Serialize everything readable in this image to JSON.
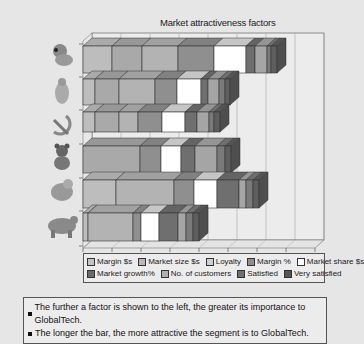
{
  "chart_data": {
    "type": "bar",
    "orientation": "horizontal",
    "stacked": true,
    "style": "3d",
    "title": "Market attractiveness factors",
    "xlabel": "",
    "ylabel": "",
    "grid": true,
    "legend_position": "bottom",
    "categories": [
      "Segment 1 (panda icon)",
      "Segment 2 (polar bear icon)",
      "Segment 3 (hammer and sickle icon)",
      "Segment 4 (teddy bear icon)",
      "Segment 5 (koala icon)",
      "Segment 6 (brown bear icon)"
    ],
    "x_ticks": 9,
    "series": [
      {
        "name": "Margin $s",
        "color": "#bdbdbd",
        "values": [
          29,
          12,
          12,
          0,
          33,
          5
        ]
      },
      {
        "name": "Market size $s",
        "color": "#a9a9a9",
        "values": [
          30,
          24,
          24,
          57,
          0,
          0
        ]
      },
      {
        "name": "Loyalty",
        "color": "#b3b3b3",
        "values": [
          36,
          36,
          19,
          0,
          58,
          45
        ]
      },
      {
        "name": "Margin %",
        "color": "#8f8f8f",
        "values": [
          36,
          22,
          24,
          21,
          20,
          8
        ]
      },
      {
        "name": "Market share $s",
        "color": "#ffffff",
        "values": [
          32,
          24,
          23,
          20,
          23,
          18
        ]
      },
      {
        "name": "Market growth%",
        "color": "#6f6f6f",
        "values": [
          9,
          7,
          12,
          14,
          22,
          19
        ]
      },
      {
        "name": "No. of customers",
        "color": "#a5a5a5",
        "values": [
          12,
          11,
          12,
          22,
          23,
          8
        ]
      },
      {
        "name": "Satisfied",
        "color": "#7a7a7a",
        "values": [
          4,
          6,
          5,
          8,
          7,
          7
        ]
      },
      {
        "name": "Very satisfied",
        "color": "#5e5e5e",
        "values": [
          6,
          5,
          6,
          6,
          8,
          6
        ]
      }
    ],
    "row_totals_px": [
      212,
      148,
      138,
      169,
      195,
      128
    ],
    "segment_boundaries_px": [
      [
        83,
        112,
        142,
        178,
        214,
        246,
        255,
        267,
        271,
        277
      ],
      [
        83,
        95,
        119,
        155,
        177,
        201,
        208,
        219,
        225,
        230
      ],
      [
        83,
        95,
        119,
        138,
        162,
        185,
        197,
        209,
        214,
        220
      ],
      [
        83,
        140,
        161,
        181,
        195,
        217,
        225,
        231
      ],
      [
        83,
        116,
        174,
        194,
        217,
        239,
        246,
        253,
        259
      ],
      [
        83,
        88,
        133,
        141,
        159,
        178,
        186,
        193,
        199
      ]
    ]
  },
  "title": "Market attractiveness factors",
  "legend": {
    "items": [
      {
        "label": "Margin $s",
        "color": "#c4c4c4"
      },
      {
        "label": "Market size $s",
        "color": "#b8b8b8"
      },
      {
        "label": "Loyalty",
        "color": "#cfcfcf"
      },
      {
        "label": "Margin %",
        "color": "#8f8f8f"
      },
      {
        "label": "Market share $s",
        "color": "#ffffff"
      },
      {
        "label": "Market growth%",
        "color": "#6a6a6a"
      },
      {
        "label": "No. of customers",
        "color": "#b0b0b0"
      },
      {
        "label": "Satisfied",
        "color": "#6f6f6f"
      },
      {
        "label": "Very satisfied",
        "color": "#555555"
      }
    ]
  },
  "notes": [
    "The further a factor is shown to the left, the greater its importance to GlobalTech.",
    "The longer the bar, the more attractive the segment is to GlobalTech."
  ],
  "segment_icons": [
    "panda-icon",
    "polar-bear-icon",
    "hammer-sickle-icon",
    "teddy-bear-icon",
    "koala-icon",
    "brown-bear-icon"
  ]
}
